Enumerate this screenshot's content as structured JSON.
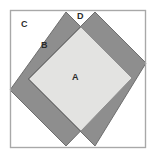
{
  "figure": {
    "name": "overlapping-squares-geometry-figure",
    "type": "geometric-diagram",
    "background_color": "#ffffff",
    "canvas": {
      "width": 156,
      "height": 158
    }
  },
  "outer_square": {
    "label": "outer-frame",
    "stroke_color": "#a8a8a8",
    "fill_color": "#ffffff",
    "stroke_width": 1.2,
    "x": 10.5,
    "y": 10.5,
    "width": 135,
    "height": 137
  },
  "diamonds": [
    {
      "name": "left-diamond",
      "fill_color": "#8e8e8e",
      "stroke_color": "#6e6e6e",
      "points": "66,12 132,78 66,146 10,90"
    },
    {
      "name": "right-diamond",
      "fill_color": "#8e8e8e",
      "stroke_color": "#6e6e6e",
      "points": "95,12 146,63 95,146 28,79"
    }
  ],
  "overlap_region": {
    "name": "central-light-square",
    "fill_color": "#e3e3e1",
    "stroke_color": "#8e8e8e",
    "points": "81,27 132,78 81,131 29,79"
  },
  "labels": [
    {
      "id": "A",
      "text": "A",
      "region": "central-overlap-square",
      "x": 72,
      "y": 73
    },
    {
      "id": "B",
      "text": "B",
      "region": "left-diamond-upper-band",
      "x": 41,
      "y": 41
    },
    {
      "id": "C",
      "text": "C",
      "region": "outer-square-corner-white",
      "x": 21,
      "y": 20
    },
    {
      "id": "D",
      "text": "D",
      "region": "top-white-triangle-between-apexes",
      "x": 77,
      "y": 12
    }
  ],
  "colors": {
    "gray_fill": "#8e8e8e",
    "light_fill": "#e3e3e1",
    "frame_stroke": "#a8a8a8",
    "shape_stroke": "#6e6e6e",
    "label_text": "#2b2b2b",
    "white": "#ffffff"
  }
}
